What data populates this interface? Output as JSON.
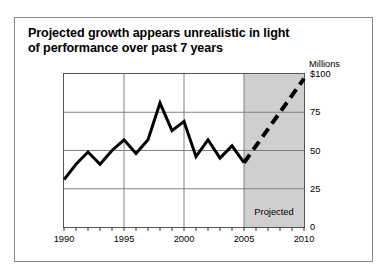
{
  "title": {
    "line1": "Projected growth appears unrealistic in light",
    "line2": "of performance over past 7 years"
  },
  "axis": {
    "unit_label": "Millions",
    "projected_label": "Projected"
  },
  "chart_data": {
    "type": "line",
    "title": "Projected growth appears unrealistic in light of performance over past 7 years",
    "xlabel": "",
    "ylabel": "Millions",
    "xlim": [
      1990,
      2010
    ],
    "ylim": [
      0,
      100
    ],
    "grid": true,
    "legend": false,
    "ytick_labels": [
      "$100",
      "75",
      "50",
      "25",
      "0"
    ],
    "ytick_values": [
      100,
      75,
      50,
      25,
      0
    ],
    "xtick_labels": [
      "1990",
      "1995",
      "2000",
      "2005",
      "2010"
    ],
    "xtick_values": [
      1990,
      1995,
      2000,
      2005,
      2010
    ],
    "minor_xticks": true,
    "annotations": [
      {
        "text": "Projected",
        "x": 2007.5,
        "y": 10,
        "shaded_region": [
          2005,
          2010
        ]
      }
    ],
    "series": [
      {
        "name": "Actual",
        "style": "solid",
        "color": "#000000",
        "x": [
          1990,
          1991,
          1992,
          1993,
          1994,
          1995,
          1996,
          1997,
          1998,
          1999,
          2000,
          2001,
          2002,
          2003,
          2004,
          2005
        ],
        "values": [
          31,
          41,
          49,
          41,
          50,
          57,
          48,
          57,
          81,
          63,
          69,
          46,
          57,
          45,
          53,
          42
        ]
      },
      {
        "name": "Projected",
        "style": "dashed",
        "color": "#000000",
        "x": [
          2005,
          2010
        ],
        "values": [
          42,
          97
        ]
      }
    ]
  }
}
